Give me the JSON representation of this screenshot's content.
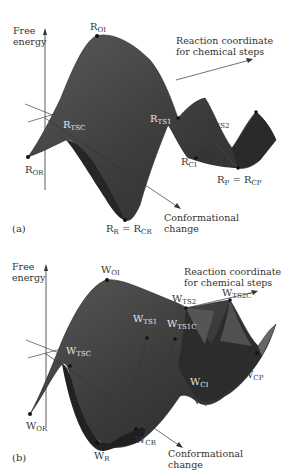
{
  "figure": {
    "panels": [
      {
        "id": "a",
        "tag": "(a)",
        "axes": {
          "y_label_line1": "Free",
          "y_label_line2": "energy",
          "x_label_line1": "Reaction coordinate",
          "x_label_line2": "for chemical steps",
          "z_label_line1": "Conformational",
          "z_label_line2": "change"
        },
        "points": {
          "ROI": {
            "main": "R",
            "sub": "OI"
          },
          "RTS2": {
            "main": "R",
            "sub": "TS2"
          },
          "RTSC": {
            "main": "R",
            "sub": "TSC"
          },
          "RTS1": {
            "main": "R",
            "sub": "TS1"
          },
          "RCI": {
            "main": "R",
            "sub": "CI"
          },
          "ROR": {
            "main": "R",
            "sub": "OR"
          },
          "RP": {
            "main": "R",
            "sub": "P",
            "eq": " = R",
            "sub2": "CP"
          },
          "RR": {
            "main": "R",
            "sub": "R",
            "eq": " = R",
            "sub2": "CR"
          }
        }
      },
      {
        "id": "b",
        "tag": "(b)",
        "axes": {
          "y_label_line1": "Free",
          "y_label_line2": "energy",
          "x_label_line1": "Reaction coordinate",
          "x_label_line2": "for chemical steps",
          "z_label_line1": "Conformational",
          "z_label_line2": "change"
        },
        "points": {
          "WOI": {
            "main": "W",
            "sub": "OI"
          },
          "WTS2": {
            "main": "W",
            "sub": "TS2"
          },
          "WTS2C": {
            "main": "W",
            "sub": "TS2C"
          },
          "WTS1": {
            "main": "W",
            "sub": "TS1"
          },
          "WTS1C": {
            "main": "W",
            "sub": "TS1C"
          },
          "WTSC": {
            "main": "W",
            "sub": "TSC"
          },
          "WCI": {
            "main": "W",
            "sub": "CI"
          },
          "WCP": {
            "main": "W",
            "sub": "CP"
          },
          "WP": {
            "main": "W",
            "sub": "P"
          },
          "WOR": {
            "main": "W",
            "sub": "OR"
          },
          "WCR": {
            "main": "W",
            "sub": "CR"
          },
          "WR": {
            "main": "W",
            "sub": "R"
          }
        }
      }
    ],
    "colors": {
      "surface_dark": "#2e2e2e",
      "surface_mid": "#4a4a4a",
      "surface_light": "#6a6a6a",
      "axis": "#333333"
    }
  }
}
